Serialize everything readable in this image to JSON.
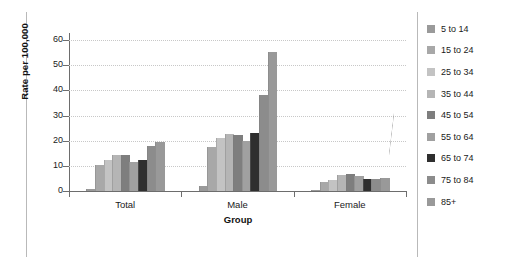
{
  "chart_data": {
    "type": "bar",
    "title": "",
    "xlabel": "Group",
    "ylabel": "Rate per 100,000",
    "categories": [
      "Total",
      "Male",
      "Female"
    ],
    "ylim": [
      0,
      62
    ],
    "yticks": [
      0,
      10,
      20,
      30,
      40,
      50,
      60
    ],
    "ytick_labels": [
      "0",
      "10",
      "20",
      "30",
      "40",
      "50",
      "60"
    ],
    "grid": true,
    "legend_position": "right",
    "series": [
      {
        "name": "5 to 14",
        "color": "#9a9a9a",
        "values": [
          0.8,
          1.9,
          0.6
        ]
      },
      {
        "name": "15 to 24",
        "color": "#a8a8a8",
        "values": [
          10.2,
          17.4,
          3.6
        ]
      },
      {
        "name": "25 to 34",
        "color": "#c3c3c3",
        "values": [
          12.3,
          21.0,
          4.5
        ]
      },
      {
        "name": "35 to 44",
        "color": "#b5b5b5",
        "values": [
          14.4,
          22.5,
          6.4
        ]
      },
      {
        "name": "45 to 54",
        "color": "#7e7e7e",
        "values": [
          14.5,
          22.2,
          6.8
        ]
      },
      {
        "name": "55 to 64",
        "color": "#a0a0a0",
        "values": [
          11.6,
          19.8,
          5.8
        ]
      },
      {
        "name": "65 to 74",
        "color": "#2f2f2f",
        "values": [
          12.5,
          23.1,
          4.9
        ]
      },
      {
        "name": "75 to 84",
        "color": "#8c8c8c",
        "values": [
          17.7,
          38.3,
          4.9
        ]
      },
      {
        "name": "85+",
        "color": "#999999",
        "values": [
          19.4,
          55.2,
          5.2
        ]
      }
    ]
  },
  "legend": {
    "items": [
      {
        "label": "5 to 14"
      },
      {
        "label": "15 to 24"
      },
      {
        "label": "25 to 34"
      },
      {
        "label": "35 to 44"
      },
      {
        "label": "45 to 54"
      },
      {
        "label": "55 to 64"
      },
      {
        "label": "65 to 74"
      },
      {
        "label": "75 to 84"
      },
      {
        "label": "85+"
      }
    ]
  }
}
